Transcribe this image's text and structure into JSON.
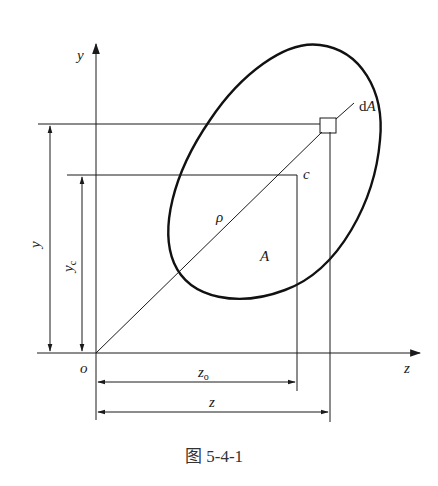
{
  "figure": {
    "caption": "图 5-4-1",
    "labels": {
      "y_axis": "y",
      "z_axis": "z",
      "origin": "o",
      "centroid": "c",
      "area_element": "dA",
      "area_element_d": "d",
      "area_element_A": "A",
      "area": "A",
      "radius": "ρ",
      "y_dim": "y",
      "yc_dim_main": "y",
      "yc_dim_sub": "c",
      "z0_dim_main": "z",
      "z0_dim_sub": "o",
      "z_dim": "z"
    },
    "colors": {
      "line": "#1a1a1a",
      "background": "#ffffff"
    }
  }
}
